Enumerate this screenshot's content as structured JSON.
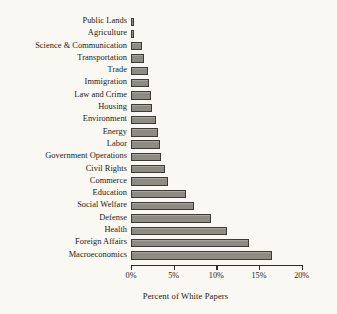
{
  "chart_data": {
    "type": "bar",
    "orientation": "horizontal",
    "title": "",
    "xlabel": "Percent of White Papers",
    "ylabel": "",
    "xlim": [
      0,
      20
    ],
    "x_tick_labels": [
      "0%",
      "5%",
      "10%",
      "15%",
      "20%"
    ],
    "x_ticks": [
      0,
      5,
      10,
      15,
      20
    ],
    "grid": false,
    "legend": null,
    "bar_color": "#8d8b82",
    "bar_edge_color": "#3d3b35",
    "background_color": "#faf8f2",
    "categories": [
      "Public Lands",
      "Agriculture",
      "Science & Communication",
      "Transportation",
      "Trade",
      "Immigration",
      "Law and Crime",
      "Housing",
      "Environment",
      "Energy",
      "Labor",
      "Government Operations",
      "Civil Rights",
      "Commerce",
      "Education",
      "Social Welfare",
      "Defense",
      "Health",
      "Foreign Affairs",
      "Macroeconomics"
    ],
    "values": [
      0.3,
      0.4,
      1.3,
      1.5,
      2.0,
      2.1,
      2.3,
      2.5,
      2.9,
      3.2,
      3.4,
      3.5,
      4.0,
      4.3,
      6.5,
      7.4,
      9.4,
      11.2,
      13.8,
      16.5
    ],
    "units": "percent"
  }
}
